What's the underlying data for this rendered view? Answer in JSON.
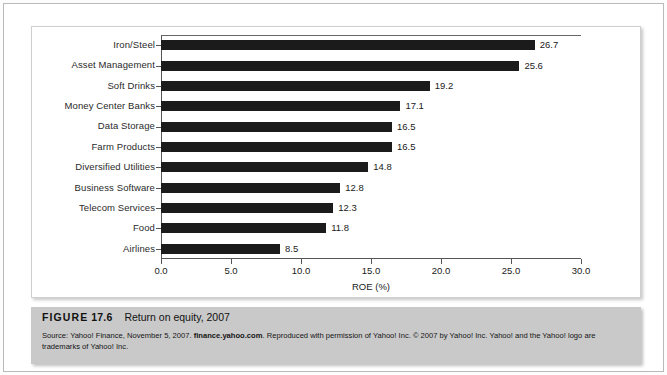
{
  "figure": {
    "caption_label": "FIGURE",
    "caption_number": "17.6",
    "caption_description": "Return on equity, 2007",
    "source_prefix": "Source: Yahoo! Finance, November 5, 2007. ",
    "source_link": "finance.yahoo.com",
    "source_suffix": ". Reproduced with permission of Yahoo! Inc. © 2007 by Yahoo! Inc. Yahoo! and the Yahoo! logo are trademarks of Yahoo! Inc."
  },
  "chart_data": {
    "type": "bar",
    "orientation": "horizontal",
    "title": "Return on equity, 2007",
    "xlabel": "ROE (%)",
    "ylabel": "",
    "xlim": [
      0.0,
      30.0
    ],
    "xticks": [
      "0.0",
      "5.0",
      "10.0",
      "15.0",
      "20.0",
      "25.0",
      "30.0"
    ],
    "xtick_values": [
      0,
      5,
      10,
      15,
      20,
      25,
      30
    ],
    "grid": false,
    "legend": null,
    "bar_color": "#1b1b1b",
    "categories": [
      "Iron/Steel",
      "Asset Management",
      "Soft Drinks",
      "Money Center Banks",
      "Data Storage",
      "Farm Products",
      "Diversified Utilities",
      "Business Software",
      "Telecom Services",
      "Food",
      "Airlines"
    ],
    "values": [
      26.7,
      25.6,
      19.2,
      17.1,
      16.5,
      16.5,
      14.8,
      12.8,
      12.3,
      11.8,
      8.5
    ],
    "value_labels": [
      "26.7",
      "25.6",
      "19.2",
      "17.1",
      "16.5",
      "16.5",
      "14.8",
      "12.8",
      "12.3",
      "11.8",
      "8.5"
    ]
  }
}
